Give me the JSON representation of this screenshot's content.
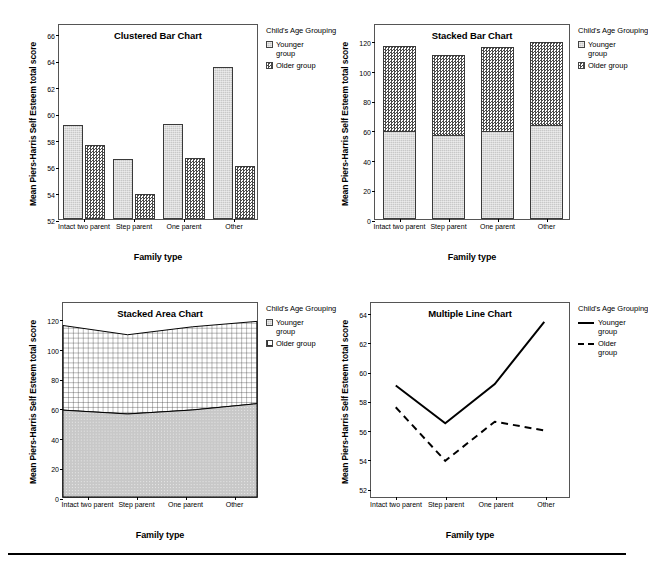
{
  "figure": {
    "background": "#ffffff",
    "series_colors": {
      "younger": "#c8c8c8",
      "older": "#ffffff",
      "line": "#000000"
    }
  },
  "shared": {
    "categories": [
      "Intact two parent",
      "Step parent",
      "One parent",
      "Other"
    ],
    "legend_title": "Child's Age Grouping",
    "series_names": {
      "younger": "Younger group",
      "older": "Older group"
    },
    "xlabel": "Family type",
    "ylabel": "Mean Piers-Harris Self Esteem total score"
  },
  "panels": {
    "clustered": {
      "title": "Clustered Bar Chart",
      "yticks": [
        "52",
        "54",
        "56",
        "58",
        "60",
        "62",
        "64",
        "66"
      ]
    },
    "stacked": {
      "title": "Stacked Bar Chart",
      "yticks": [
        "0",
        "20",
        "40",
        "60",
        "80",
        "100",
        "120"
      ]
    },
    "area": {
      "title": "Stacked Area Chart",
      "yticks": [
        "0",
        "20",
        "40",
        "60",
        "80",
        "100",
        "120"
      ]
    },
    "line": {
      "title": "Multiple Line Chart",
      "yticks": [
        "52",
        "54",
        "56",
        "58",
        "60",
        "62",
        "64"
      ]
    }
  },
  "chart_data": [
    {
      "type": "bar",
      "id": "clustered-bar-chart",
      "title": "Clustered Bar Chart",
      "xlabel": "Family type",
      "ylabel": "Mean Piers-Harris Self Esteem total score",
      "categories": [
        "Intact two parent",
        "Step parent",
        "One parent",
        "Other"
      ],
      "series": [
        {
          "name": "Younger group",
          "values": [
            59.1,
            56.5,
            59.2,
            63.5
          ]
        },
        {
          "name": "Older group",
          "values": [
            57.6,
            53.9,
            56.6,
            56.0
          ]
        }
      ],
      "ylim": [
        52,
        66.8
      ],
      "yticks": [
        52,
        54,
        56,
        58,
        60,
        62,
        64,
        66
      ],
      "grid": false,
      "legend_position": "right",
      "legend_title": "Child's Age Grouping"
    },
    {
      "type": "bar",
      "id": "stacked-bar-chart",
      "title": "Stacked Bar Chart",
      "xlabel": "Family type",
      "ylabel": "Mean Piers-Harris Self Esteem total score",
      "stacked": true,
      "categories": [
        "Intact two parent",
        "Step parent",
        "One parent",
        "Other"
      ],
      "series": [
        {
          "name": "Younger group",
          "values": [
            59.1,
            56.5,
            59.2,
            63.5
          ]
        },
        {
          "name": "Older group",
          "values": [
            57.6,
            53.9,
            56.6,
            56.0
          ]
        }
      ],
      "totals": [
        116.7,
        110.4,
        115.8,
        119.5
      ],
      "ylim": [
        0,
        132
      ],
      "yticks": [
        0,
        20,
        40,
        60,
        80,
        100,
        120
      ],
      "grid": false,
      "legend_position": "right",
      "legend_title": "Child's Age Grouping"
    },
    {
      "type": "area",
      "id": "stacked-area-chart",
      "title": "Stacked Area Chart",
      "xlabel": "Family type",
      "ylabel": "Mean Piers-Harris Self Esteem total score",
      "stacked": true,
      "categories": [
        "Intact two parent",
        "Step parent",
        "One parent",
        "Other"
      ],
      "series": [
        {
          "name": "Younger group",
          "values": [
            59.1,
            56.5,
            59.2,
            63.5
          ]
        },
        {
          "name": "Older group",
          "values": [
            57.6,
            53.9,
            56.6,
            56.0
          ]
        }
      ],
      "totals": [
        116.7,
        110.4,
        115.8,
        119.5
      ],
      "ylim": [
        0,
        132
      ],
      "yticks": [
        0,
        20,
        40,
        60,
        80,
        100,
        120
      ],
      "grid": false,
      "legend_position": "right",
      "legend_title": "Child's Age Grouping"
    },
    {
      "type": "line",
      "id": "multiple-line-chart",
      "title": "Multiple Line Chart",
      "xlabel": "Family type",
      "ylabel": "Mean Piers-Harris Self Esteem total score",
      "categories": [
        "Intact two parent",
        "Step parent",
        "One parent",
        "Other"
      ],
      "series": [
        {
          "name": "Younger group",
          "values": [
            59.1,
            56.5,
            59.2,
            63.5
          ],
          "style": "solid"
        },
        {
          "name": "Older group",
          "values": [
            57.6,
            53.9,
            56.6,
            56.0
          ],
          "style": "dashed"
        }
      ],
      "ylim": [
        51.4,
        64.8
      ],
      "yticks": [
        52,
        54,
        56,
        58,
        60,
        62,
        64
      ],
      "grid": false,
      "legend_position": "right",
      "legend_title": "Child's Age Grouping"
    }
  ]
}
